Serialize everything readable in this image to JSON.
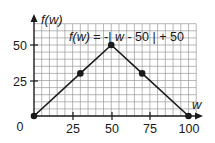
{
  "chart_data": {
    "type": "line",
    "title": "f(w) = -| w - 50 | + 50",
    "xlabel": "w",
    "ylabel": "f(w)",
    "x_ticks": [
      "25",
      "50",
      "75",
      "100"
    ],
    "y_ticks": [
      "25",
      "50"
    ],
    "origin_label": "0",
    "xlim": [
      0,
      105
    ],
    "ylim": [
      0,
      65
    ],
    "grid": true,
    "grid_step": 5,
    "series": [
      {
        "name": "f(w) = -| w - 50 | + 50",
        "x": [
          0,
          30,
          50,
          70,
          100
        ],
        "y": [
          0,
          30,
          50,
          30,
          0
        ],
        "markers": true
      }
    ],
    "colors": {
      "line": "#1a1a1a",
      "grid": "#9a9a9a",
      "axis": "#1a1a1a"
    }
  },
  "labels": {
    "equation": "f(w) = -| w - 50 | + 50",
    "y_axis": "f(w)",
    "x_axis": "w",
    "origin": "0",
    "x25": "25",
    "x50": "50",
    "x75": "75",
    "x100": "100",
    "y25": "25",
    "y50": "50"
  }
}
